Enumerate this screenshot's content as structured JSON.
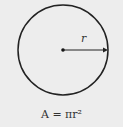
{
  "diagram": {
    "radius_label": "r",
    "formula": "A = πr²",
    "colors": {
      "background": "#ededed",
      "stroke": "#222222"
    }
  }
}
